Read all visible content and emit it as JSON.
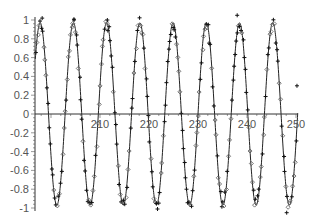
{
  "chart_data": {
    "type": "scatter",
    "title": "",
    "xlabel": "",
    "ylabel": "",
    "xlim": [
      196.8,
      250.4
    ],
    "ylim": [
      -1,
      1
    ],
    "grid": false,
    "legend": null,
    "x_ticks": [
      210,
      220,
      230,
      240,
      250
    ],
    "x_tick_labels": [
      "210",
      "220",
      "230",
      "240",
      "250"
    ],
    "y_ticks": [
      1,
      0.8,
      0.6,
      0.4,
      0.2,
      0,
      -0.2,
      -0.4,
      -0.6,
      -0.8,
      -1
    ],
    "y_tick_labels": [
      "1",
      "0.8",
      "0.6",
      "0.4",
      "0.2",
      "0",
      "-0.2",
      "-0.4",
      "-0.6",
      "-0.8",
      "-1"
    ],
    "series": [
      {
        "name": "fitted sine curve",
        "kind": "line",
        "color": "#222222",
        "function": "y = sin(2*pi*(x - 196.1)/6.78)",
        "amplitude": 0.97,
        "period": 6.78,
        "phase_zero_crossing": 196.1
      },
      {
        "name": "data points (+)",
        "kind": "markers",
        "marker": "plus",
        "color": "#111111",
        "note": "noisy samples scattered along the sine curve"
      },
      {
        "name": "data points (diamond)",
        "kind": "markers",
        "marker": "diamond",
        "color": "#555555",
        "note": "noisy samples scattered along the sine curve"
      }
    ],
    "peaks_x": [
      197.8,
      204.5,
      211.4,
      217.9,
      224.5,
      231.3,
      238.0,
      244.7
    ],
    "troughs_x": [
      201.2,
      208.0,
      214.7,
      221.1,
      227.7,
      234.7,
      241.4,
      248.1
    ]
  },
  "axes": {
    "origin_px": {
      "x": 35,
      "y": 114
    },
    "x_px_per_unit": 4.9,
    "y_px_per_unit": 94,
    "x_ref_value": 210,
    "x_ref_px": 100
  }
}
